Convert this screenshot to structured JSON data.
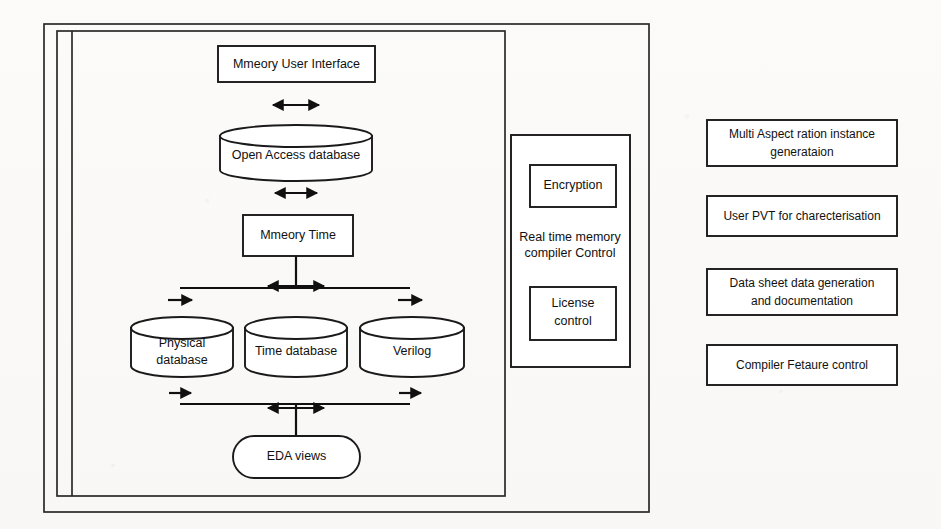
{
  "diagram": {
    "title_present": false,
    "background_color": "#fdfdfc",
    "line_color": "#1a1a1a",
    "text_color": "#111111",
    "left_panel": {
      "name": "memory-compiler-flow",
      "nodes": [
        {
          "id": "ui",
          "label": "Mmeory User Interface",
          "shape": "rect"
        },
        {
          "id": "oadb",
          "label": "Open Access database",
          "shape": "cylinder"
        },
        {
          "id": "mtime",
          "label": "Mmeory Time",
          "shape": "rect"
        },
        {
          "id": "physdb",
          "label": "Physical database",
          "label_line1": "Physical",
          "label_line2": "database",
          "shape": "cylinder"
        },
        {
          "id": "timedb",
          "label": "Time database",
          "shape": "cylinder"
        },
        {
          "id": "verilog",
          "label": "Verilog",
          "shape": "cylinder"
        },
        {
          "id": "eda",
          "label": "EDA views",
          "shape": "rounded"
        }
      ],
      "edges": [
        {
          "from": "ui",
          "to": "oadb",
          "style": "double-arrow"
        },
        {
          "from": "oadb",
          "to": "mtime",
          "style": "double-arrow"
        },
        {
          "from": "mtime",
          "to": "physdb",
          "style": "branch-down"
        },
        {
          "from": "mtime",
          "to": "timedb",
          "style": "double-arrow"
        },
        {
          "from": "mtime",
          "to": "verilog",
          "style": "branch-down"
        },
        {
          "from": "eda",
          "to": "physdb",
          "style": "bus-up"
        },
        {
          "from": "eda",
          "to": "timedb",
          "style": "double-arrow"
        },
        {
          "from": "eda",
          "to": "verilog",
          "style": "bus-up"
        }
      ]
    },
    "control_panel": {
      "name": "real-time-memory-compiler-control",
      "caption_line1": "Real time memory",
      "caption_line2": "compiler Control",
      "boxes": [
        {
          "id": "encryption",
          "label": "Encryption"
        },
        {
          "id": "license-control",
          "label_line1": "License",
          "label_line2": "control",
          "label": "License control"
        }
      ]
    },
    "feature_list": {
      "name": "feature-boxes",
      "boxes": [
        {
          "id": "multi-aspect-ratio",
          "label_line1": "Multi Aspect ration instance",
          "label_line2": "generataion",
          "label": "Multi Aspect ration instance generataion"
        },
        {
          "id": "user-pvt",
          "label_line1": "User  PVT for charecterisation",
          "label_line2": "",
          "label": "User  PVT for charecterisation"
        },
        {
          "id": "data-sheet",
          "label_line1": "Data sheet data generation",
          "label_line2": "and documentation",
          "label": "Data sheet data generation and documentation"
        },
        {
          "id": "compiler-feature",
          "label_line1": "Compiler Fetaure control",
          "label_line2": "",
          "label": "Compiler Fetaure control"
        }
      ]
    }
  }
}
